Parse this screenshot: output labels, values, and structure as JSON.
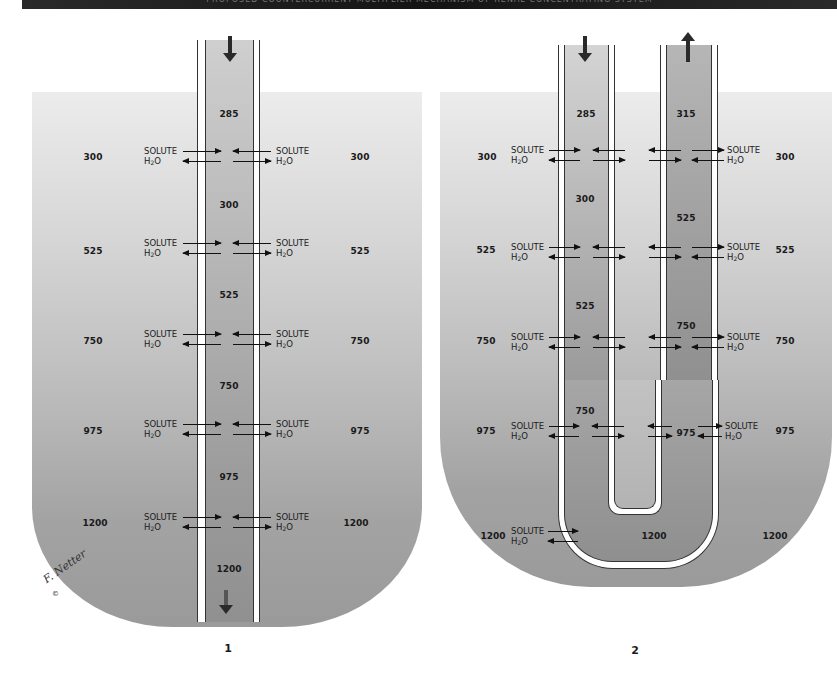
{
  "header": {
    "title": "PROPOSED COUNTERCURRENT MULTIPLIER MECHANISM OF RENAL CONCENTRATING SYSTEM"
  },
  "labels": {
    "solute": "SOLUTE",
    "water_h": "H",
    "water_sub": "2",
    "water_o": "O"
  },
  "figure_1": {
    "number": "1",
    "flow_direction": "down",
    "interstitial_levels": [
      "300",
      "525",
      "750",
      "975",
      "1200"
    ],
    "tubule_values": [
      "285",
      "300",
      "525",
      "750",
      "975",
      "1200"
    ],
    "exchange_rows": 5,
    "signature": "F. Netter",
    "copyright": "©"
  },
  "figure_2": {
    "number": "2",
    "descending_flow": "down",
    "ascending_flow": "up",
    "interstitial_levels": [
      "300",
      "525",
      "750",
      "975",
      "1200"
    ],
    "descending_values": [
      "285",
      "300",
      "525",
      "750"
    ],
    "ascending_values": [
      "315",
      "525",
      "750",
      "975"
    ],
    "bend_value": "1200",
    "exchange_rows": 5
  },
  "colors": {
    "interstitium_top": "#ececec",
    "interstitium_bottom": "#9a9a9a",
    "tubule_wall": "#ffffff",
    "outline": "#333333",
    "arrow": "#111111"
  }
}
